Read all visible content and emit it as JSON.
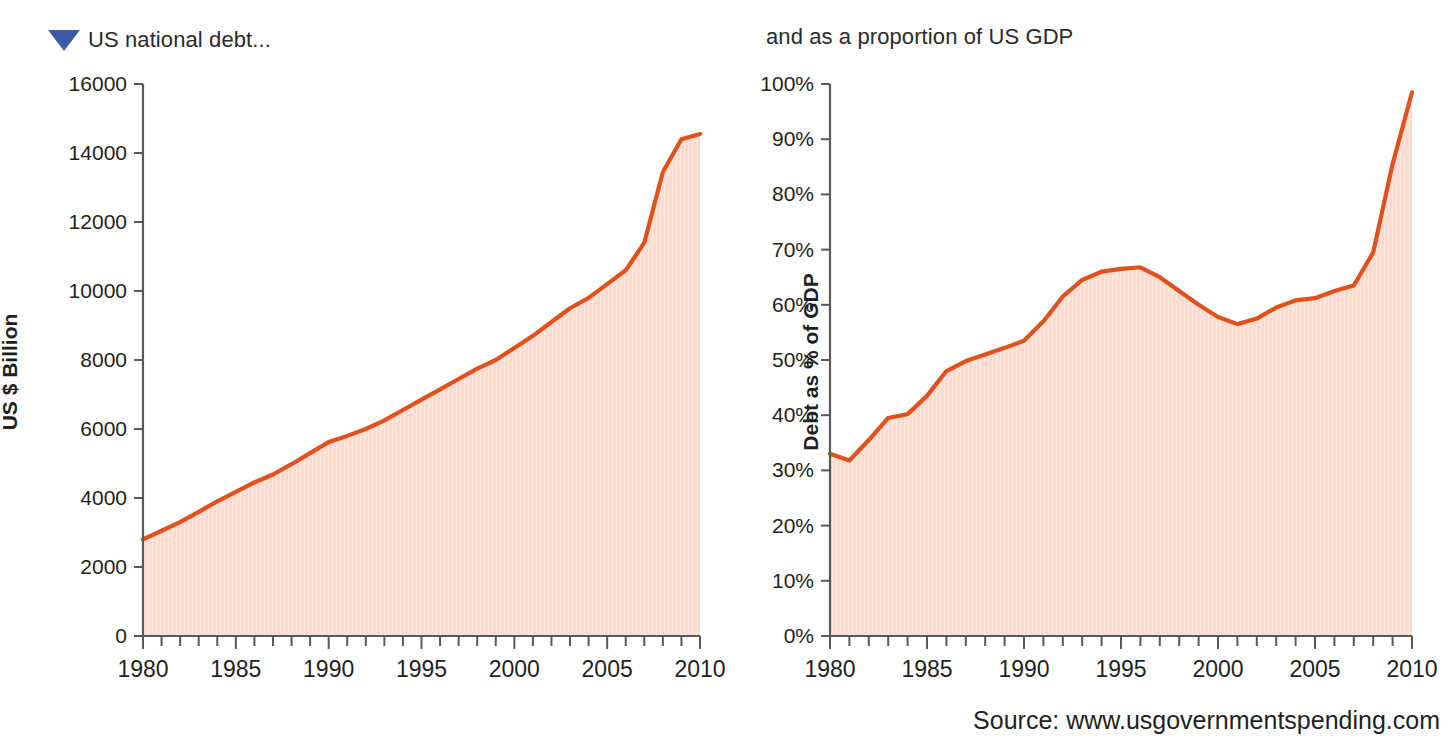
{
  "figure": {
    "marker_icon": "triangle-down-icon",
    "marker_color": "#3b5ba8",
    "line_color": "#e0511e",
    "fill_color": "#fadbcf",
    "source": "Source: www.usgovernmentspending.com"
  },
  "chart_data": [
    {
      "type": "area",
      "title": "US national debt...",
      "xlabel": "",
      "ylabel": "US $ Billion",
      "xlim": [
        1980,
        2010
      ],
      "ylim": [
        0,
        16000
      ],
      "ytick_labels": [
        "0",
        "2000",
        "4000",
        "6000",
        "8000",
        "10000",
        "12000",
        "14000",
        "16000"
      ],
      "yticks": [
        0,
        2000,
        4000,
        6000,
        8000,
        10000,
        12000,
        14000,
        16000
      ],
      "xtick_labels": [
        "1980",
        "1985",
        "1990",
        "1995",
        "2000",
        "2005",
        "2010"
      ],
      "xticks": [
        1980,
        1985,
        1990,
        1995,
        2000,
        2005,
        2010
      ],
      "grid": false,
      "legend": "none",
      "x": [
        1980,
        1981,
        1982,
        1983,
        1984,
        1985,
        1986,
        1987,
        1988,
        1989,
        1990,
        1991,
        1992,
        1993,
        1994,
        1995,
        1996,
        1997,
        1998,
        1999,
        2000,
        2001,
        2002,
        2003,
        2004,
        2005,
        2006,
        2007,
        2008,
        2009,
        2010
      ],
      "values": [
        2800,
        3050,
        3300,
        3600,
        3900,
        4180,
        4450,
        4680,
        4980,
        5300,
        5620,
        5800,
        6000,
        6250,
        6550,
        6850,
        7150,
        7450,
        7750,
        8000,
        8350,
        8700,
        9100,
        9500,
        9800,
        10200,
        10600,
        11400,
        13450,
        14400,
        14550
      ]
    },
    {
      "type": "area",
      "title": "and as a proportion of US GDP",
      "xlabel": "",
      "ylabel": "Debt as % of GDP",
      "xlim": [
        1980,
        2010
      ],
      "ylim": [
        0,
        100
      ],
      "ytick_labels": [
        "0%",
        "10%",
        "20%",
        "30%",
        "40%",
        "50%",
        "60%",
        "70%",
        "80%",
        "90%",
        "100%"
      ],
      "yticks": [
        0,
        10,
        20,
        30,
        40,
        50,
        60,
        70,
        80,
        90,
        100
      ],
      "xtick_labels": [
        "1980",
        "1985",
        "1990",
        "1995",
        "2000",
        "2005",
        "2010"
      ],
      "xticks": [
        1980,
        1985,
        1990,
        1995,
        2000,
        2005,
        2010
      ],
      "grid": false,
      "legend": "none",
      "x": [
        1980,
        1981,
        1982,
        1983,
        1984,
        1985,
        1986,
        1987,
        1988,
        1989,
        1990,
        1991,
        1992,
        1993,
        1994,
        1995,
        1996,
        1997,
        1998,
        1999,
        2000,
        2001,
        2002,
        2003,
        2004,
        2005,
        2006,
        2007,
        2008,
        2009,
        2010
      ],
      "values": [
        33.0,
        31.8,
        35.5,
        39.5,
        40.2,
        43.5,
        48.0,
        49.8,
        51.0,
        52.2,
        53.5,
        57.0,
        61.5,
        64.5,
        66.0,
        66.5,
        66.8,
        65.0,
        62.5,
        60.0,
        57.8,
        56.5,
        57.5,
        59.5,
        60.8,
        61.2,
        62.5,
        63.5,
        69.5,
        85.5,
        98.5
      ]
    }
  ]
}
